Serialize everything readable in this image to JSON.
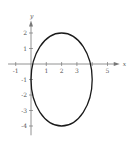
{
  "chart_data": {
    "type": "line",
    "title": "",
    "xlabel": "x",
    "ylabel": "y",
    "xlim": [
      -1.5,
      5.8
    ],
    "ylim": [
      -4.6,
      2.8
    ],
    "grid": false,
    "x_ticks": [
      -1,
      1,
      2,
      3,
      5
    ],
    "y_ticks": [
      2,
      1,
      -1,
      -2,
      -3,
      -4
    ],
    "x_tick_labels": [
      "-1",
      "1",
      "2",
      "3",
      "5"
    ],
    "y_tick_labels": [
      "2",
      "1",
      "-1",
      "-2",
      "-3",
      "-4"
    ],
    "series": [
      {
        "name": "ellipse",
        "shape": "ellipse",
        "center": [
          2,
          -1
        ],
        "semi_axis_x": 2,
        "semi_axis_y": 3,
        "extents": {
          "x_min": 0,
          "x_max": 4,
          "y_min": -4,
          "y_max": 2
        }
      }
    ],
    "colors": {
      "curve": "#1a1a1a",
      "axis": "#777777"
    }
  },
  "axes": {
    "x_label": "x",
    "y_label": "y"
  }
}
